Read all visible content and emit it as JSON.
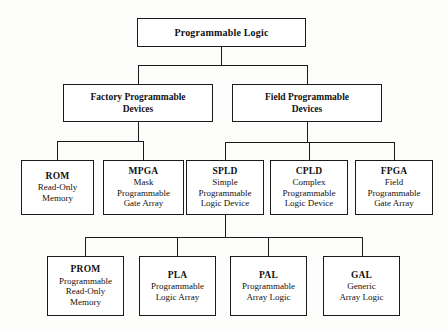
{
  "diagram": {
    "type": "hierarchy-tree",
    "line_color": "#1a1a1a",
    "box_fill": "#ffffff",
    "background": "#fdfdfc"
  },
  "nodes": {
    "root": {
      "acronym": "Programmable Logic",
      "expansion": []
    },
    "factory": {
      "acronym": "",
      "expansion": [
        "Factory Programmable",
        "Devices"
      ]
    },
    "field": {
      "acronym": "",
      "expansion": [
        "Field Programmable",
        "Devices"
      ]
    },
    "rom": {
      "acronym": "ROM",
      "expansion": [
        "Read-Only",
        "Memory"
      ]
    },
    "mpga": {
      "acronym": "MPGA",
      "expansion": [
        "Mask",
        "Programmable",
        "Gate Array"
      ]
    },
    "spld": {
      "acronym": "SPLD",
      "expansion": [
        "Simple",
        "Programmable",
        "Logic Device"
      ]
    },
    "cpld": {
      "acronym": "CPLD",
      "expansion": [
        "Complex",
        "Programmable",
        "Logic Device"
      ]
    },
    "fpga": {
      "acronym": "FPGA",
      "expansion": [
        "Field",
        "Programmable",
        "Gate Array"
      ]
    },
    "prom": {
      "acronym": "PROM",
      "expansion": [
        "Programmable",
        "Read-Only",
        "Memory"
      ]
    },
    "pla": {
      "acronym": "PLA",
      "expansion": [
        "Programmable",
        "Logic Array"
      ]
    },
    "pal": {
      "acronym": "PAL",
      "expansion": [
        "Programmable",
        "Array Logic"
      ]
    },
    "gal": {
      "acronym": "GAL",
      "expansion": [
        "Generic",
        "Array Logic"
      ]
    }
  }
}
